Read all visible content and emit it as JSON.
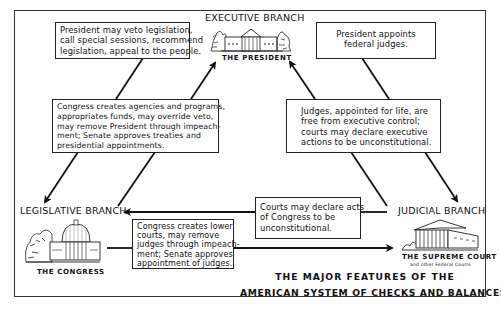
{
  "diagram": {
    "title_lines": [
      "THE MAJOR FEATURES OF THE",
      "AMERICAN SYSTEM OF CHECKS  AND BALANCES"
    ],
    "branches": {
      "executive": {
        "label": "EXECUTIVE BRANCH",
        "caption": "THE PRESIDENT",
        "illustration": "white-house"
      },
      "legislative": {
        "label": "LEGISLATIVE BRANCH",
        "caption": "THE CONGRESS",
        "illustration": "capitol-building"
      },
      "judicial": {
        "label": "JUDICIAL BRANCH",
        "caption": "THE SUPREME COURT",
        "subcaption": "and other Federal Courts",
        "illustration": "supreme-court-building"
      }
    },
    "checks": {
      "exec_on_leg": {
        "from": "executive",
        "to": "legislative",
        "lines": [
          "President may veto legislation,",
          "call special sessions, recommend",
          "legislation, appeal to the people."
        ]
      },
      "leg_on_exec": {
        "from": "legislative",
        "to": "executive",
        "lines": [
          "Congress creates agencies and programs,",
          "appropriates funds, may override veto,",
          "may remove President through impeach-",
          "ment; Senate approves treaties and",
          "presidential appointments."
        ]
      },
      "exec_on_jud": {
        "from": "executive",
        "to": "judicial",
        "lines": [
          "President appoints",
          "federal judges."
        ]
      },
      "jud_on_exec": {
        "from": "judicial",
        "to": "executive",
        "lines": [
          "Judges, appointed for life, are",
          "free from executive control;",
          "courts may declare executive",
          "actions to be unconstitutional."
        ]
      },
      "jud_on_leg": {
        "from": "judicial",
        "to": "legislative",
        "lines": [
          "Courts may declare acts",
          "of Congress to be",
          "unconstitutional."
        ]
      },
      "leg_on_jud": {
        "from": "legislative",
        "to": "judicial",
        "lines": [
          "Congress creates lower",
          "courts, may remove",
          "judges through impeach-",
          "ment; Senate approves",
          "appointment of judges."
        ]
      }
    },
    "colors": {
      "ink": "#111111",
      "background": "#ffffff",
      "frame": "#333333"
    }
  }
}
